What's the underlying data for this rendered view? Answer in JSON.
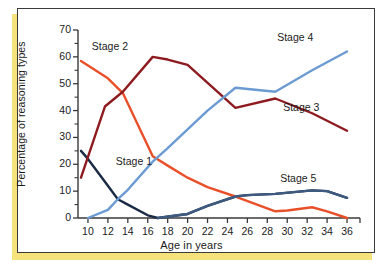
{
  "figure": {
    "background": "#ffffff",
    "border_color": "#3a3a3a",
    "accent_color": "#f5e27a"
  },
  "chart_data": {
    "type": "line",
    "title": "",
    "xlabel": "Age in years",
    "ylabel": "Percentage of reasoning types",
    "xlim": [
      9,
      36.5
    ],
    "ylim": [
      0,
      70
    ],
    "xticks": [
      10,
      12,
      14,
      16,
      18,
      20,
      22,
      24,
      26,
      28,
      30,
      32,
      34,
      36
    ],
    "yticks": [
      0,
      10,
      20,
      30,
      40,
      50,
      60,
      70
    ],
    "grid": false,
    "legend_position": "inline-annotations",
    "series": [
      {
        "name": "Stage 1",
        "color": "#1b2b45",
        "label_x": 15.0,
        "label_y": 21.0,
        "x": [
          9.3,
          10,
          12,
          13,
          14,
          16,
          17,
          20,
          22,
          24.8,
          26,
          28.8,
          32.5,
          34,
          36
        ],
        "values": [
          25.0,
          22.0,
          12.0,
          7.0,
          5.0,
          1.0,
          0.0,
          1.5,
          4.5,
          8.0,
          8.5,
          9.0,
          10.3,
          10.0,
          7.5
        ]
      },
      {
        "name": "Stage 2",
        "color": "#e8502a",
        "label_x": 12.6,
        "label_y": 63.5,
        "x": [
          9.3,
          12,
          13.5,
          16.5,
          18,
          20,
          22,
          24.8,
          28.8,
          30,
          32.5,
          34,
          36
        ],
        "values": [
          58.5,
          52.0,
          46.5,
          23.0,
          19.5,
          15.0,
          11.5,
          8.0,
          2.5,
          2.8,
          4.0,
          2.5,
          0.0
        ]
      },
      {
        "name": "Stage 3",
        "color": "#8e1b1f",
        "label_x": 31.8,
        "label_y": 41.0,
        "x": [
          9.3,
          11.7,
          13.5,
          16.5,
          18,
          20,
          24.8,
          28.8,
          32.5,
          36
        ],
        "values": [
          15.0,
          41.5,
          47.0,
          60.0,
          59.0,
          57.0,
          41.0,
          44.5,
          39.0,
          32.5
        ]
      },
      {
        "name": "Stage 4",
        "color": "#6b9bd2",
        "label_x": 31.2,
        "label_y": 67.0,
        "x": [
          10,
          12,
          13,
          14,
          16.5,
          18,
          20,
          22,
          24.8,
          28.8,
          32.5,
          36
        ],
        "values": [
          0.0,
          3.0,
          7.0,
          10.5,
          21.0,
          26.0,
          33.0,
          40.0,
          48.5,
          47.0,
          55.0,
          62.0
        ]
      },
      {
        "name": "Stage 5",
        "color": "#3d5a80",
        "label_x": 31.5,
        "label_y": 14.5,
        "x": [
          17,
          20,
          22,
          24.8,
          26,
          28.8,
          32.5,
          34,
          36
        ],
        "values": [
          0.0,
          1.5,
          4.5,
          8.0,
          8.5,
          9.0,
          10.3,
          10.0,
          7.5
        ]
      }
    ]
  }
}
